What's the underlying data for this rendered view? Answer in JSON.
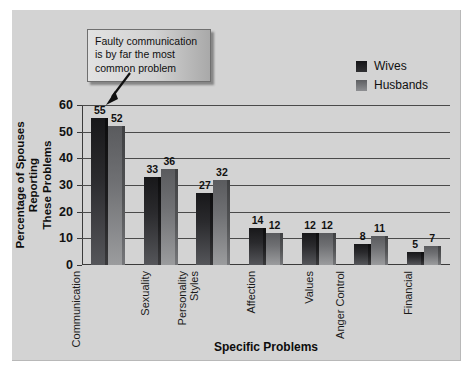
{
  "chart_data": {
    "type": "bar",
    "title": "",
    "xlabel": "Specific Problems",
    "ylabel": "Percentage of Spouses Reporting These Problems",
    "ylim": [
      0,
      60
    ],
    "yticks": [
      0,
      10,
      20,
      30,
      40,
      50,
      60
    ],
    "grid": true,
    "legend_position": "top-right",
    "categories": [
      "Communication",
      "Sexuality",
      "Personality Styles",
      "Affection",
      "Values",
      "Anger Control",
      "Financial"
    ],
    "series": [
      {
        "name": "Wives",
        "color": "#222225",
        "values": [
          55,
          33,
          27,
          14,
          12,
          8,
          5
        ]
      },
      {
        "name": "Husbands",
        "color": "#7b7c7f",
        "values": [
          52,
          36,
          32,
          12,
          12,
          11,
          7
        ]
      }
    ],
    "annotations": [
      {
        "text": "Faulty communication is by far the most common problem",
        "points_to": "Communication"
      }
    ]
  },
  "figure": {
    "background": "#d3d3d3",
    "page_background": "#ffffff",
    "axis_color": "#3a3a3a"
  },
  "axis_titles": {
    "y_line1": "Percentage of Spouses Reporting",
    "y_line2": "These Problems",
    "x": "Specific Problems"
  },
  "callout": {
    "line1": "Faulty communication",
    "line2": "is by far the most",
    "line3": "common problem"
  }
}
